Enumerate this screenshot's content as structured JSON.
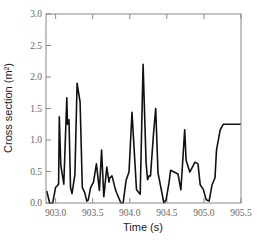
{
  "chart_data": {
    "type": "line",
    "title": "",
    "xlabel": "Time (s)",
    "ylabel": "Cross section (m²)",
    "xlim": [
      902.87,
      905.5
    ],
    "ylim": [
      0.0,
      3.0
    ],
    "xticks": [
      903.0,
      903.5,
      904.0,
      904.5,
      905.0,
      905.5
    ],
    "xtick_labels": [
      "903.0",
      "903.5",
      "904.0",
      "904.5",
      "905.0",
      "905.5"
    ],
    "yticks": [
      0.0,
      0.5,
      1.0,
      1.5,
      2.0,
      2.5,
      3.0
    ],
    "ytick_labels": [
      "0.0",
      "0.5",
      "1.0",
      "1.5",
      "2.0",
      "2.5",
      "3.0"
    ],
    "grid": false,
    "legend": null,
    "series": [
      {
        "name": "Cross section",
        "color": "#111111",
        "x": [
          902.88,
          902.92,
          902.96,
          903.0,
          903.02,
          903.04,
          903.05,
          903.07,
          903.11,
          903.15,
          903.16,
          903.18,
          903.2,
          903.22,
          903.26,
          903.29,
          903.33,
          903.36,
          903.39,
          903.42,
          903.44,
          903.47,
          903.51,
          903.55,
          903.59,
          903.62,
          903.65,
          903.69,
          903.72,
          903.73,
          903.76,
          903.8,
          903.82,
          903.88,
          903.91,
          903.95,
          903.99,
          904.03,
          904.09,
          904.14,
          904.18,
          904.22,
          904.24,
          904.26,
          904.28,
          904.32,
          904.35,
          904.38,
          904.46,
          904.49,
          904.53,
          904.55,
          904.65,
          904.69,
          904.74,
          904.76,
          904.81,
          904.88,
          904.92,
          904.95,
          904.99,
          905.03,
          905.07,
          905.11,
          905.15,
          905.17,
          905.22,
          905.26,
          905.3,
          905.32,
          905.37,
          905.41,
          905.45,
          905.47,
          905.49,
          905.5
        ],
        "y": [
          0.19,
          0.0,
          0.0,
          0.25,
          0.27,
          0.3,
          1.37,
          0.6,
          0.3,
          1.67,
          1.25,
          1.32,
          0.25,
          0.15,
          0.45,
          1.9,
          1.6,
          0.25,
          0.17,
          0.03,
          0.05,
          0.24,
          0.33,
          0.62,
          0.2,
          0.84,
          0.1,
          0.57,
          0.33,
          0.4,
          0.43,
          0.24,
          0.17,
          0.0,
          0.0,
          0.36,
          0.49,
          1.44,
          0.21,
          0.14,
          2.2,
          0.63,
          0.37,
          0.43,
          0.43,
          1.1,
          1.5,
          0.48,
          0.0,
          0.05,
          0.33,
          0.52,
          0.46,
          0.21,
          1.16,
          0.68,
          0.49,
          0.65,
          0.62,
          0.29,
          0.22,
          0.05,
          0.03,
          0.29,
          0.4,
          0.84,
          1.16,
          1.25,
          1.25,
          1.25,
          1.25,
          1.25,
          1.25,
          1.25,
          1.25,
          1.25
        ]
      }
    ]
  }
}
